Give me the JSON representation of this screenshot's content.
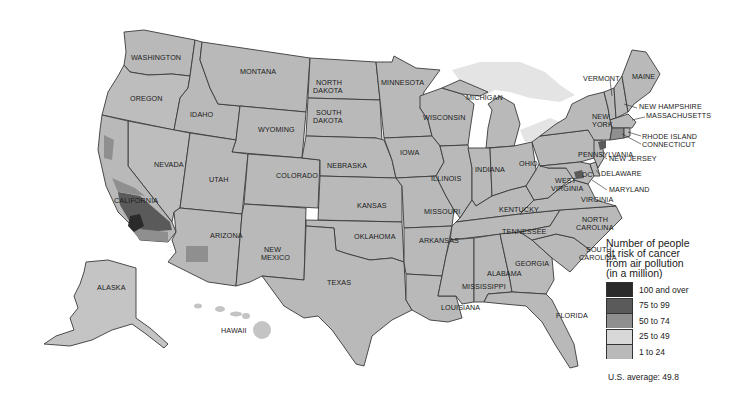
{
  "map": {
    "title": "Number of people at risk of cancer from air pollution (in a million)",
    "region": "United States (by county)",
    "state_labels": [
      {
        "name": "WASHINGTON",
        "x": 131,
        "y": 60
      },
      {
        "name": "OREGON",
        "x": 130,
        "y": 101
      },
      {
        "name": "IDAHO",
        "x": 190,
        "y": 117
      },
      {
        "name": "MONTANA",
        "x": 240,
        "y": 74
      },
      {
        "name": "WYOMING",
        "x": 258,
        "y": 132
      },
      {
        "name": "NORTH",
        "x": 316,
        "y": 85
      },
      {
        "name": "DAKOTA",
        "x": 313,
        "y": 93
      },
      {
        "name": "SOUTH",
        "x": 316,
        "y": 115
      },
      {
        "name": "DAKOTA",
        "x": 313,
        "y": 123
      },
      {
        "name": "MINNESOTA",
        "x": 381,
        "y": 85
      },
      {
        "name": "WISCONSIN",
        "x": 423,
        "y": 120
      },
      {
        "name": "MICHIGAN",
        "x": 466,
        "y": 100
      },
      {
        "name": "NEVADA",
        "x": 154,
        "y": 167
      },
      {
        "name": "UTAH",
        "x": 209,
        "y": 182
      },
      {
        "name": "COLORADO",
        "x": 276,
        "y": 178
      },
      {
        "name": "NEBRASKA",
        "x": 327,
        "y": 168
      },
      {
        "name": "IOWA",
        "x": 400,
        "y": 155
      },
      {
        "name": "ILLINOIS",
        "x": 431,
        "y": 181
      },
      {
        "name": "INDIANA",
        "x": 475,
        "y": 172
      },
      {
        "name": "OHIO",
        "x": 519,
        "y": 166
      },
      {
        "name": "PENNSYLVANIA",
        "x": 578,
        "y": 157
      },
      {
        "name": "NEW",
        "x": 592,
        "y": 119
      },
      {
        "name": "YORK",
        "x": 592,
        "y": 127
      },
      {
        "name": "CALIFORNIA",
        "x": 114,
        "y": 203
      },
      {
        "name": "KANSAS",
        "x": 357,
        "y": 208
      },
      {
        "name": "MISSOURI",
        "x": 424,
        "y": 214
      },
      {
        "name": "KENTUCKY",
        "x": 499,
        "y": 212
      },
      {
        "name": "WEST",
        "x": 555,
        "y": 183
      },
      {
        "name": "VIRGINIA",
        "x": 551,
        "y": 191
      },
      {
        "name": "VIRGINIA",
        "x": 581,
        "y": 202
      },
      {
        "name": "ARIZONA",
        "x": 210,
        "y": 238
      },
      {
        "name": "NEW",
        "x": 264,
        "y": 252
      },
      {
        "name": "MEXICO",
        "x": 261,
        "y": 260
      },
      {
        "name": "OKLAHOMA",
        "x": 354,
        "y": 239
      },
      {
        "name": "ARKANSAS",
        "x": 419,
        "y": 243
      },
      {
        "name": "TENNESSEE",
        "x": 502,
        "y": 234
      },
      {
        "name": "NORTH",
        "x": 582,
        "y": 222
      },
      {
        "name": "CAROLINA",
        "x": 576,
        "y": 230
      },
      {
        "name": "SOUTH",
        "x": 586,
        "y": 252
      },
      {
        "name": "CAROLINA",
        "x": 579,
        "y": 260
      },
      {
        "name": "ALABAMA",
        "x": 487,
        "y": 276
      },
      {
        "name": "GEORGIA",
        "x": 515,
        "y": 266
      },
      {
        "name": "MISSISSIPPI",
        "x": 462,
        "y": 289
      },
      {
        "name": "TEXAS",
        "x": 327,
        "y": 285
      },
      {
        "name": "LOUISIANA",
        "x": 441,
        "y": 310
      },
      {
        "name": "FLORIDA",
        "x": 556,
        "y": 318
      },
      {
        "name": "ALASKA",
        "x": 97,
        "y": 290
      },
      {
        "name": "HAWAII",
        "x": 221,
        "y": 333
      },
      {
        "name": "VERMONT",
        "x": 583,
        "y": 81
      },
      {
        "name": "MAINE",
        "x": 632,
        "y": 79
      },
      {
        "name": "NEW HAMPSHIRE",
        "x": 639,
        "y": 109
      },
      {
        "name": "MASSACHUSETTS",
        "x": 646,
        "y": 118
      },
      {
        "name": "RHODE ISLAND",
        "x": 642,
        "y": 139
      },
      {
        "name": "CONNECTICUT",
        "x": 642,
        "y": 147
      },
      {
        "name": "NEW JERSEY",
        "x": 609,
        "y": 161
      },
      {
        "name": "DELAWARE",
        "x": 601,
        "y": 176
      },
      {
        "name": "MARYLAND",
        "x": 609,
        "y": 192
      },
      {
        "name": "DC",
        "x": 582,
        "y": 177
      }
    ]
  },
  "legend": {
    "title_lines": [
      "Number of people",
      "at risk of cancer",
      "from air pollution",
      "(in a million)"
    ],
    "items": [
      {
        "label": "100 and over",
        "color": "#2a2a2a"
      },
      {
        "label": "75 to 99",
        "color": "#5a5a5a"
      },
      {
        "label": "50 to 74",
        "color": "#8f8f8f"
      },
      {
        "label": "25 to 49",
        "color": "#d8d8d8"
      },
      {
        "label": "1 to 24",
        "color": "#b9b9b9"
      }
    ],
    "average": "U.S. average: 49.8"
  },
  "colors": {
    "base_fill": "#b9b9b9",
    "light_fill": "#d8d8d8",
    "mid_fill": "#8f8f8f",
    "dark_fill": "#5a5a5a",
    "darkest_fill": "#2a2a2a",
    "border": "#3a3a3a",
    "lake": "#e4e4e4"
  }
}
